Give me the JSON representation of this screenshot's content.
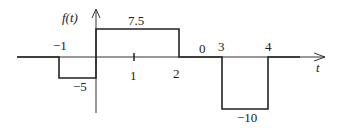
{
  "diagram": {
    "y_axis_label": "f(t)",
    "x_axis_label": "t",
    "colors": {
      "line": "#222222",
      "axis": "#333333",
      "background": "#ffffff"
    },
    "segments": [
      {
        "t_start": "-inf",
        "t_end": -1,
        "value": 0
      },
      {
        "t_start": -1,
        "t_end": 0,
        "value": -5
      },
      {
        "t_start": 0,
        "t_end": 2,
        "value": 7.5
      },
      {
        "t_start": 2,
        "t_end": 3,
        "value": 0
      },
      {
        "t_start": 3,
        "t_end": 4,
        "value": -10
      },
      {
        "t_start": 4,
        "t_end": "inf",
        "value": 0
      }
    ],
    "labels": {
      "t_minus1": "−1",
      "t_1": "1",
      "t_2": "2",
      "t_3": "3",
      "t_4": "4",
      "v_7_5": "7.5",
      "v_minus5": "−5",
      "v_minus10": "−10",
      "v_0": "0"
    }
  }
}
